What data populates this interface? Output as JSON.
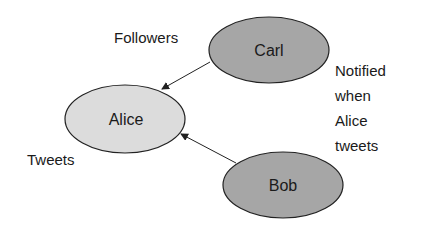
{
  "diagram": {
    "nodes": [
      {
        "id": "carl",
        "label": "Carl",
        "fill": "#a6a6a6",
        "cx": 269,
        "cy": 50,
        "rx": 60,
        "ry": 33
      },
      {
        "id": "alice",
        "label": "Alice",
        "fill": "#dcdcdc",
        "cx": 125,
        "cy": 119,
        "rx": 60,
        "ry": 34
      },
      {
        "id": "bob",
        "label": "Bob",
        "fill": "#a6a6a6",
        "cx": 283,
        "cy": 185,
        "rx": 60,
        "ry": 33
      }
    ],
    "edges": [
      {
        "from": "carl",
        "to": "alice"
      },
      {
        "from": "bob",
        "to": "alice"
      }
    ],
    "annotations": {
      "followers": "Followers",
      "tweets": "Tweets",
      "notified": [
        "Notified",
        "when",
        "Alice",
        "tweets"
      ]
    },
    "colors": {
      "stroke": "#222222",
      "text": "#1a1a1a"
    }
  }
}
